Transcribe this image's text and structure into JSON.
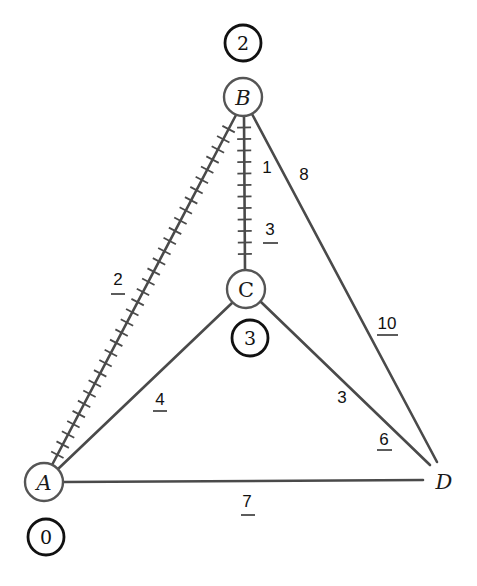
{
  "diagram": {
    "type": "weighted-graph-dijkstra",
    "nodes": [
      {
        "id": "A",
        "label": "A",
        "x": 44,
        "y": 482,
        "distance": "0"
      },
      {
        "id": "B",
        "label": "B",
        "x": 243,
        "y": 97,
        "distance": "2"
      },
      {
        "id": "C",
        "label": "C",
        "x": 246,
        "y": 289,
        "distance": "3"
      },
      {
        "id": "D",
        "label": "D",
        "x": 444,
        "y": 481,
        "distance": null
      }
    ],
    "edges": [
      {
        "from": "A",
        "to": "B",
        "weight": "2",
        "underlined": true,
        "highlighted": true
      },
      {
        "from": "B",
        "to": "C",
        "weights": [
          "1",
          "3"
        ],
        "underlined_weight": "3",
        "highlighted": true
      },
      {
        "from": "B",
        "to": "D",
        "weights": [
          "8",
          "10"
        ],
        "underlined_weight": "10",
        "highlighted": false
      },
      {
        "from": "A",
        "to": "C",
        "weight": "4",
        "underlined": true,
        "highlighted": false
      },
      {
        "from": "C",
        "to": "D",
        "weights": [
          "3",
          "6"
        ],
        "underlined_weight": "6",
        "highlighted": false
      },
      {
        "from": "A",
        "to": "D",
        "weight": "7",
        "underlined": true,
        "highlighted": false
      }
    ],
    "labels": {
      "node_A": "A",
      "node_B": "B",
      "node_C": "C",
      "node_D": "D",
      "dist_A": "0",
      "dist_B": "2",
      "dist_C": "3",
      "w_AB": "2",
      "w_BC_1": "1",
      "w_BC_3": "3",
      "w_BD_8": "8",
      "w_BD_10": "10",
      "w_AC": "4",
      "w_CD_3": "3",
      "w_CD_6": "6",
      "w_AD": "7"
    },
    "colors": {
      "edge": "#4a4a4a",
      "label_circle": "#111111",
      "background": "#ffffff"
    }
  }
}
